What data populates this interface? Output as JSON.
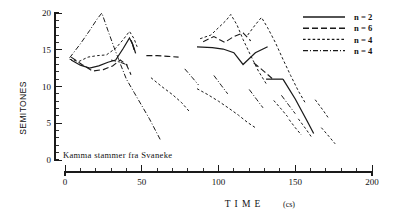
{
  "figure": {
    "annotation": "Kamma stammer fra Svaneke",
    "y_axis_label": "SEMITONES",
    "x_axis_label": "T I M E",
    "x_axis_unit": "(cs)"
  },
  "chart_data": {
    "type": "line",
    "title": "",
    "subtitle": "",
    "annotation": "Kamma stammer fra Svaneke",
    "xlabel": "TIME (cs)",
    "ylabel": "SEMITONES",
    "xlim": [
      0,
      200
    ],
    "ylim": [
      0,
      20
    ],
    "xticks": [
      0,
      50,
      100,
      150,
      200
    ],
    "yticks": [
      0,
      5,
      10,
      15,
      20
    ],
    "x_minor_tick_step": 10,
    "y_minor_tick_step": 1,
    "grid": false,
    "legend_position": "top-right",
    "legend": [
      {
        "label": "n = 2",
        "style": "solid"
      },
      {
        "label": "n = 6",
        "style": "long-dash"
      },
      {
        "label": "n = 4",
        "style": "short-dash"
      },
      {
        "label": "n = 4",
        "style": "dash-dot"
      }
    ],
    "series": [
      {
        "name": "n = 2",
        "style": "solid",
        "dasharray": "",
        "width": 1.25,
        "segments": [
          {
            "points": [
              [
                4,
                13.6
              ],
              [
                10,
                12.9
              ],
              [
                16,
                12.5
              ],
              [
                22,
                12.8
              ],
              [
                28,
                13.3
              ],
              [
                33,
                13.6
              ],
              [
                38,
                15.2
              ],
              [
                42,
                16.6
              ],
              [
                44,
                15.8
              ],
              [
                45,
                15.0
              ]
            ]
          },
          {
            "points": [
              [
                43,
                16.3
              ],
              [
                45,
                15.2
              ],
              [
                46,
                14.5
              ]
            ]
          },
          {
            "points": [
              [
                86,
                15.4
              ],
              [
                96,
                15.3
              ],
              [
                103,
                15.1
              ],
              [
                110,
                14.6
              ],
              [
                116,
                13.0
              ],
              [
                124,
                14.6
              ],
              [
                132,
                15.4
              ]
            ]
          },
          {
            "points": [
              [
                131,
                11.0
              ],
              [
                142,
                11.0
              ]
            ]
          },
          {
            "points": [
              [
                142,
                11.0
              ],
              [
                150,
                8.3
              ],
              [
                158,
                5.2
              ],
              [
                162,
                3.6
              ]
            ]
          }
        ]
      },
      {
        "name": "n = 6",
        "style": "long-dash",
        "dasharray": "6 3",
        "width": 1.1,
        "segments": [
          {
            "points": [
              [
                4,
                14.0
              ],
              [
                11,
                13.0
              ],
              [
                18,
                12.1
              ],
              [
                25,
                12.3
              ],
              [
                31,
                12.8
              ],
              [
                36,
                13.6
              ],
              [
                40,
                13.0
              ],
              [
                43,
                11.6
              ]
            ]
          },
          {
            "points": [
              [
                53,
                14.2
              ],
              [
                60,
                14.2
              ],
              [
                67,
                14.1
              ],
              [
                74,
                14.0
              ]
            ]
          },
          {
            "points": [
              [
                90,
                16.1
              ],
              [
                97,
                16.8
              ],
              [
                104,
                16.0
              ],
              [
                110,
                16.8
              ],
              [
                116,
                17.3
              ],
              [
                121,
                16.2
              ]
            ]
          },
          {
            "points": [
              [
                123,
                13.2
              ],
              [
                130,
                12.0
              ],
              [
                136,
                10.9
              ]
            ]
          }
        ]
      },
      {
        "name": "n = 4",
        "style": "short-dash",
        "dasharray": "2.6 2.2",
        "width": 1.0,
        "segments": [
          {
            "points": [
              [
                3,
                13.7
              ],
              [
                9,
                13.4
              ],
              [
                15,
                14.0
              ],
              [
                21,
                14.2
              ],
              [
                27,
                14.3
              ],
              [
                33,
                15.2
              ],
              [
                38,
                16.4
              ],
              [
                42,
                17.5
              ],
              [
                45,
                16.5
              ],
              [
                47,
                15.4
              ]
            ]
          },
          {
            "points": [
              [
                56,
                11.2
              ],
              [
                63,
                10.0
              ],
              [
                70,
                8.9
              ],
              [
                76,
                7.8
              ],
              [
                81,
                6.6
              ]
            ]
          },
          {
            "points": [
              [
                86,
                9.7
              ],
              [
                93,
                8.9
              ],
              [
                100,
                8.0
              ],
              [
                107,
                7.0
              ],
              [
                113,
                6.1
              ],
              [
                119,
                5.1
              ],
              [
                124,
                4.4
              ]
            ]
          },
          {
            "points": [
              [
                88,
                16.5
              ],
              [
                95,
                17.0
              ],
              [
                100,
                18.0
              ],
              [
                105,
                19.0
              ],
              [
                108,
                19.8
              ],
              [
                112,
                18.4
              ],
              [
                116,
                16.4
              ],
              [
                121,
                14.2
              ],
              [
                126,
                12.1
              ],
              [
                131,
                10.4
              ]
            ]
          },
          {
            "points": [
              [
                119,
                17.0
              ],
              [
                124,
                18.4
              ],
              [
                128,
                19.4
              ],
              [
                132,
                18.0
              ],
              [
                137,
                16.0
              ],
              [
                142,
                13.7
              ],
              [
                147,
                11.5
              ],
              [
                152,
                9.4
              ],
              [
                157,
                7.6
              ]
            ]
          },
          {
            "points": [
              [
                136,
                8.1
              ],
              [
                141,
                6.9
              ],
              [
                145,
                5.9
              ]
            ]
          },
          {
            "points": [
              [
                146,
                5.5
              ],
              [
                150,
                4.4
              ],
              [
                154,
                3.4
              ]
            ]
          },
          {
            "points": [
              [
                152,
                5.6
              ],
              [
                157,
                4.2
              ],
              [
                161,
                3.0
              ]
            ]
          },
          {
            "points": [
              [
                163,
                8.2
              ],
              [
                168,
                6.8
              ],
              [
                172,
                5.6
              ]
            ]
          },
          {
            "points": [
              [
                167,
                4.4
              ],
              [
                172,
                3.2
              ],
              [
                176,
                2.2
              ]
            ]
          }
        ]
      },
      {
        "name": "n = 4 (dash-dot)",
        "style": "dash-dot",
        "dasharray": "5 2 1 2",
        "width": 1.0,
        "segments": [
          {
            "points": [
              [
                3,
                13.9
              ],
              [
                10,
                15.8
              ],
              [
                16,
                17.6
              ],
              [
                21,
                19.2
              ],
              [
                24,
                20.0
              ],
              [
                28,
                17.6
              ],
              [
                32,
                15.3
              ],
              [
                36,
                13.1
              ],
              [
                40,
                11.0
              ],
              [
                45,
                9.2
              ],
              [
                50,
                7.4
              ],
              [
                55,
                5.6
              ],
              [
                59,
                4.0
              ],
              [
                62,
                2.8
              ]
            ]
          },
          {
            "points": [
              [
                30,
                13.6
              ],
              [
                36,
                13.3
              ],
              [
                41,
                12.9
              ]
            ]
          },
          {
            "points": [
              [
                78,
                12.4
              ],
              [
                83,
                11.2
              ],
              [
                87,
                10.2
              ]
            ]
          },
          {
            "points": [
              [
                97,
                11.5
              ],
              [
                102,
                10.1
              ],
              [
                106,
                9.0
              ]
            ]
          },
          {
            "points": [
              [
                120,
                9.6
              ],
              [
                125,
                8.2
              ],
              [
                129,
                7.1
              ]
            ]
          },
          {
            "points": [
              [
                141,
                8.8
              ],
              [
                146,
                7.4
              ],
              [
                150,
                6.3
              ]
            ]
          }
        ]
      }
    ]
  }
}
